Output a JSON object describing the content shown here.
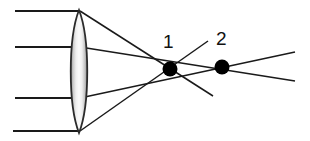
{
  "figure": {
    "kind": "optical-ray-diagram",
    "background_color": "#ffffff",
    "width": 310,
    "height": 141
  },
  "lens": {
    "name": "converging-lens",
    "shape": "biconvex",
    "center_x": 79,
    "top_vertex_y": 10,
    "bottom_vertex_y": 133,
    "half_width": 11,
    "outline_color": "#2b2b2b",
    "fill_light": "#ffffff",
    "fill_mid": "#e2e2e2",
    "fill_dark": "#9a9a9a"
  },
  "incoming_rays": {
    "color": "#1a1a1a",
    "stroke_width": 2.1,
    "items": [
      {
        "label": "ray-1",
        "x1": 15,
        "y1": 11,
        "x2": 79,
        "y2": 11
      },
      {
        "label": "ray-2",
        "x1": 15,
        "y1": 47,
        "x2": 79,
        "y2": 47
      },
      {
        "label": "ray-3",
        "x1": 15,
        "y1": 98,
        "x2": 79,
        "y2": 98
      },
      {
        "label": "ray-4",
        "x1": 13,
        "y1": 131,
        "x2": 79,
        "y2": 131
      }
    ]
  },
  "refracted_rays": {
    "color": "#1a1a1a",
    "stroke_width": 1.5,
    "items": [
      {
        "label": "refracted-from-top-edge",
        "x1": 80,
        "y1": 11,
        "x2": 213,
        "y2": 96
      },
      {
        "label": "refracted-from-upper-mid",
        "x1": 80,
        "y1": 47,
        "x2": 295,
        "y2": 81
      },
      {
        "label": "refracted-from-lower-mid",
        "x1": 80,
        "y1": 98,
        "x2": 295,
        "y2": 52
      },
      {
        "label": "refracted-from-bottom-edge",
        "x1": 80,
        "y1": 131,
        "x2": 208,
        "y2": 41
      }
    ]
  },
  "focal_points": [
    {
      "name": "focal-point-1",
      "label": "1",
      "cx": 170,
      "cy": 69,
      "r": 7.5,
      "color": "#000000",
      "label_x": 163,
      "label_y": 32
    },
    {
      "name": "focal-point-2",
      "label": "2",
      "cx": 222,
      "cy": 67,
      "r": 7.5,
      "color": "#000000",
      "label_x": 216,
      "label_y": 29
    }
  ],
  "labels": {
    "point_1": "1",
    "point_2": "2"
  }
}
